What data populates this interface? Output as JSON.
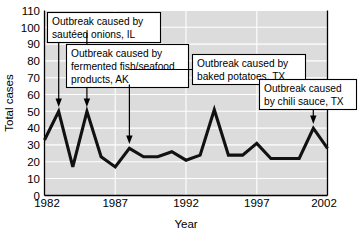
{
  "chart_data": {
    "type": "line",
    "title": "",
    "xlabel": "Year",
    "ylabel": "Total cases",
    "xlim": [
      1982,
      2002
    ],
    "ylim": [
      0,
      110
    ],
    "grid": true,
    "legend": "none",
    "x": [
      1982,
      1983,
      1984,
      1985,
      1986,
      1987,
      1988,
      1989,
      1990,
      1991,
      1992,
      1993,
      1994,
      1995,
      1996,
      1997,
      1998,
      1999,
      2000,
      2001,
      2002
    ],
    "values": [
      33,
      50,
      17,
      50,
      23,
      17,
      28,
      23,
      23,
      26,
      21,
      24,
      51,
      24,
      24,
      31,
      22,
      22,
      22,
      40,
      28
    ],
    "xticks": [
      1982,
      1987,
      1992,
      1997,
      2002
    ],
    "xtick_labels": [
      "1982",
      "1987",
      "1992",
      "1997",
      "2002"
    ],
    "yticks": [
      0,
      10,
      20,
      30,
      40,
      50,
      60,
      70,
      80,
      90,
      100,
      110
    ],
    "ytick_labels": [
      "0",
      "10",
      "20",
      "30",
      "40",
      "50",
      "60",
      "70",
      "80",
      "90",
      "100",
      "110"
    ],
    "annotations": [
      {
        "id": "sauteed-onions",
        "text_lines": [
          "Outbreak caused by",
          "sautéed onions, IL"
        ],
        "points_to_x": 1983,
        "points_to_y": 50
      },
      {
        "id": "fermented-fish",
        "text_lines": [
          "Outbreak caused by",
          "fermented fish/seafood",
          "products, AK"
        ],
        "points_to_x": 1985,
        "points_to_y": 50
      },
      {
        "id": "baked-potatoes",
        "text_lines": [
          "Outbreak caused by",
          "baked potatoes, TX"
        ],
        "points_to_x": 1988,
        "points_to_y": 28
      },
      {
        "id": "chili-sauce",
        "text_lines": [
          "Outbreak caused",
          "by chili sauce, TX"
        ],
        "points_to_x": 2001,
        "points_to_y": 40
      }
    ],
    "colors": {
      "plot_background": "#dcdcdc",
      "gridline": "#ffffff",
      "data_line": "#111111",
      "axis": "#000000",
      "callout_background": "#ffffff"
    }
  },
  "annotation_text": {
    "a0l0": "Outbreak caused by",
    "a0l1": "sautéed onions, IL",
    "a1l0": "Outbreak caused by",
    "a1l1": "fermented fish/seafood",
    "a1l2": "products, AK",
    "a2l0": "Outbreak caused by",
    "a2l1": "baked potatoes, TX",
    "a3l0": "Outbreak caused",
    "a3l1": "by chili sauce, TX"
  },
  "axes": {
    "y_title": "Total cases",
    "x_title": "Year",
    "y_labels": [
      "110",
      "100",
      "90",
      "80",
      "70",
      "60",
      "50",
      "40",
      "30",
      "20",
      "10",
      "0"
    ],
    "x_labels": [
      "1982",
      "1987",
      "1992",
      "1997",
      "2002"
    ]
  }
}
